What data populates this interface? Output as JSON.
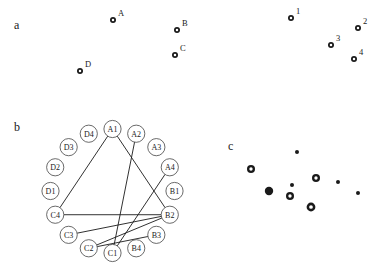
{
  "figure": {
    "width": 383,
    "height": 277,
    "background": "#ffffff",
    "ink_color": "#1a1a1a",
    "node_stroke_color": "#444444"
  },
  "panels": [
    {
      "id": "a",
      "label": "a",
      "x": 14,
      "y": 26
    },
    {
      "id": "b",
      "label": "b",
      "x": 14,
      "y": 128
    },
    {
      "id": "c",
      "label": "c",
      "x": 228,
      "y": 147
    }
  ],
  "chart_data": [
    {
      "type": "scatter",
      "id": "panel-a-left",
      "title": "a",
      "xlabel": "",
      "ylabel": "",
      "marker": "ring",
      "points": [
        {
          "label": "A",
          "x": 113,
          "y": 20,
          "label_dx": 5,
          "label_dy": -4
        },
        {
          "label": "B",
          "x": 177,
          "y": 30,
          "label_dx": 5,
          "label_dy": -4
        },
        {
          "label": "C",
          "x": 175,
          "y": 55,
          "label_dx": 5,
          "label_dy": -4
        },
        {
          "label": "D",
          "x": 80,
          "y": 71,
          "label_dx": 5,
          "label_dy": -4
        }
      ]
    },
    {
      "type": "scatter",
      "id": "panel-a-right",
      "title": "",
      "xlabel": "",
      "ylabel": "",
      "marker": "ring",
      "points": [
        {
          "label": "1",
          "x": 291,
          "y": 18,
          "label_dx": 5,
          "label_dy": -4
        },
        {
          "label": "2",
          "x": 358,
          "y": 28,
          "label_dx": 5,
          "label_dy": -4
        },
        {
          "label": "3",
          "x": 331,
          "y": 45,
          "label_dx": 5,
          "label_dy": -4
        },
        {
          "label": "4",
          "x": 354,
          "y": 59,
          "label_dx": 5,
          "label_dy": -4
        }
      ]
    },
    {
      "type": "graph",
      "id": "panel-b-circular-graph",
      "title": "b",
      "layout": "circular",
      "center_x": 112.5,
      "center_y": 191,
      "radius": 62,
      "node_radius": 8.6,
      "nodes": [
        {
          "id": "A1",
          "label": "A1",
          "angle": -90
        },
        {
          "id": "A2",
          "label": "A2",
          "angle": -67.5
        },
        {
          "id": "A3",
          "label": "A3",
          "angle": -45
        },
        {
          "id": "A4",
          "label": "A4",
          "angle": -22.5
        },
        {
          "id": "B1",
          "label": "B1",
          "angle": 0
        },
        {
          "id": "B2",
          "label": "B2",
          "angle": 22.5
        },
        {
          "id": "B3",
          "label": "B3",
          "angle": 45
        },
        {
          "id": "B4",
          "label": "B4",
          "angle": 67.5
        },
        {
          "id": "C1",
          "label": "C1",
          "angle": 90
        },
        {
          "id": "C2",
          "label": "C2",
          "angle": 112.5
        },
        {
          "id": "C3",
          "label": "C3",
          "angle": 135
        },
        {
          "id": "C4",
          "label": "C4",
          "angle": 157.5
        },
        {
          "id": "D1",
          "label": "D1",
          "angle": 180
        },
        {
          "id": "D2",
          "label": "D2",
          "angle": 202.5
        },
        {
          "id": "D3",
          "label": "D3",
          "angle": 225
        },
        {
          "id": "D4",
          "label": "D4",
          "angle": 247.5
        }
      ],
      "edges": [
        {
          "source": "A1",
          "target": "C4"
        },
        {
          "source": "A1",
          "target": "B2"
        },
        {
          "source": "C4",
          "target": "B2"
        },
        {
          "source": "A2",
          "target": "C1"
        },
        {
          "source": "A4",
          "target": "C1"
        },
        {
          "source": "C3",
          "target": "B2"
        },
        {
          "source": "C2",
          "target": "B2"
        },
        {
          "source": "C2",
          "target": "B3"
        }
      ]
    },
    {
      "type": "scatter",
      "id": "panel-c-dots",
      "title": "c",
      "xlabel": "",
      "ylabel": "",
      "points": [
        {
          "x": 297,
          "y": 152,
          "marker": "small",
          "size": 2.0
        },
        {
          "x": 251,
          "y": 169,
          "marker": "ring",
          "size": 4.0
        },
        {
          "x": 316,
          "y": 178,
          "marker": "ring",
          "size": 4.0
        },
        {
          "x": 338,
          "y": 182,
          "marker": "small",
          "size": 2.0
        },
        {
          "x": 292,
          "y": 185,
          "marker": "small",
          "size": 2.0
        },
        {
          "x": 269,
          "y": 191,
          "marker": "solid",
          "size": 4.2
        },
        {
          "x": 290,
          "y": 196,
          "marker": "ring",
          "size": 4.0
        },
        {
          "x": 358,
          "y": 193,
          "marker": "small",
          "size": 2.0
        },
        {
          "x": 311,
          "y": 207,
          "marker": "ring",
          "size": 4.4
        }
      ]
    }
  ]
}
